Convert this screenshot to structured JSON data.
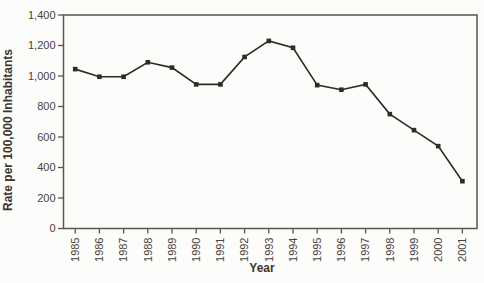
{
  "figure": {
    "background_color": "#fcfcfa"
  },
  "chart_data": {
    "type": "line",
    "title": "",
    "xlabel": "Year",
    "ylabel": "Rate per 100,000 Inhabitants",
    "categories": [
      "1985",
      "1986",
      "1987",
      "1988",
      "1989",
      "1990",
      "1991",
      "1992",
      "1993",
      "1994",
      "1995",
      "1996",
      "1997",
      "1998",
      "1999",
      "2000",
      "2001"
    ],
    "series": [
      {
        "name": "Rate per 100,000 Inhabitants",
        "values": [
          1045,
          995,
          995,
          1090,
          1055,
          945,
          945,
          1125,
          1230,
          1185,
          940,
          910,
          945,
          750,
          645,
          540,
          310
        ]
      }
    ],
    "ylim": [
      0,
      1400
    ],
    "ytick_step": 200,
    "yticks": [
      0,
      200,
      400,
      600,
      800,
      1000,
      1200,
      1400
    ],
    "ytick_labels": [
      "0",
      "200",
      "400",
      "600",
      "800",
      "1,000",
      "1,200",
      "1,400"
    ],
    "grid": "off",
    "legend": "none",
    "marker": "square",
    "colors": {
      "line": "#2d2a28",
      "marker": "#2d2a28",
      "frame": "#5a554f",
      "tick": "#5a554f",
      "tick_text": "#4a433d",
      "title_text": "#3c352f",
      "background": "#fcfcfa"
    }
  }
}
